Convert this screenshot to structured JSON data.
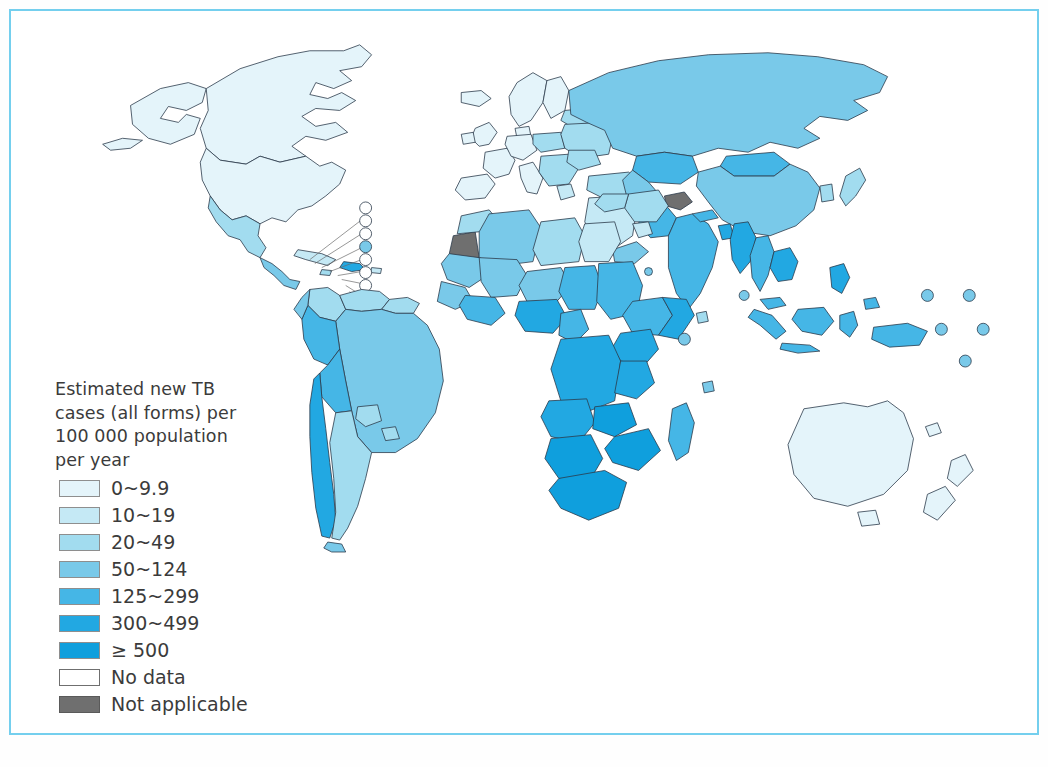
{
  "figure": {
    "domain": "map",
    "kind": "choropleth-world-map",
    "frame_color": "#74cfee",
    "background": "#ffffff"
  },
  "legend": {
    "title": "Estimated new TB\ncases (all forms) per\n100 000 population\nper year",
    "title_lines": [
      "Estimated new TB",
      "cases  (all forms)  per",
      "100 000 population",
      "per year"
    ],
    "items": [
      {
        "label": "0~9.9",
        "color": "#e4f4fa",
        "border": "#8e8e8e"
      },
      {
        "label": "10~19",
        "color": "#c5e9f5",
        "border": "#8e8e8e"
      },
      {
        "label": "20~49",
        "color": "#a2dcef",
        "border": "#8e8e8e"
      },
      {
        "label": "50~124",
        "color": "#79c9e9",
        "border": "#8e8e8e"
      },
      {
        "label": "125~299",
        "color": "#45b6e6",
        "border": "#8e8e8e"
      },
      {
        "label": "300~499",
        "color": "#22a8e2",
        "border": "#8e8e8e"
      },
      {
        "label": "≥ 500",
        "color": "#0f9fdd",
        "border": "#8e8e8e"
      },
      {
        "label": "No data",
        "color": "#ffffff",
        "border": "#6f6f6f"
      },
      {
        "label": "Not applicable",
        "color": "#6f6f6f",
        "border": "#5a5a5a"
      }
    ]
  },
  "map_data": {
    "type": "choropleth",
    "variable": "Estimated new TB cases (all forms) per 100 000 population per year",
    "classes": [
      "0~9.9",
      "10~19",
      "20~49",
      "50~124",
      "125~299",
      "300~499",
      "≥ 500",
      "No data",
      "Not applicable"
    ],
    "regions": [
      {
        "name": "Canada",
        "class": "0~9.9"
      },
      {
        "name": "United States of America",
        "class": "0~9.9"
      },
      {
        "name": "Greenland",
        "class": "125~299"
      },
      {
        "name": "Mexico",
        "class": "20~49"
      },
      {
        "name": "Central America",
        "class": "50~124"
      },
      {
        "name": "Cuba",
        "class": "10~19"
      },
      {
        "name": "Haiti",
        "class": "300~499"
      },
      {
        "name": "Colombia",
        "class": "20~49"
      },
      {
        "name": "Venezuela",
        "class": "20~49"
      },
      {
        "name": "Brazil",
        "class": "50~124"
      },
      {
        "name": "Peru",
        "class": "125~299"
      },
      {
        "name": "Bolivia",
        "class": "125~299"
      },
      {
        "name": "Ecuador",
        "class": "50~124"
      },
      {
        "name": "Chile",
        "class": "10~19"
      },
      {
        "name": "Argentina",
        "class": "20~49"
      },
      {
        "name": "Western Europe",
        "class": "0~9.9"
      },
      {
        "name": "Eastern Europe",
        "class": "20~49"
      },
      {
        "name": "Russian Federation",
        "class": "50~124"
      },
      {
        "name": "Kazakhstan",
        "class": "125~299"
      },
      {
        "name": "China",
        "class": "50~124"
      },
      {
        "name": "Mongolia",
        "class": "125~299"
      },
      {
        "name": "India",
        "class": "125~299"
      },
      {
        "name": "Pakistan",
        "class": "125~299"
      },
      {
        "name": "Bangladesh",
        "class": "300~499"
      },
      {
        "name": "Myanmar",
        "class": "300~499"
      },
      {
        "name": "Indonesia",
        "class": "125~299"
      },
      {
        "name": "Philippines",
        "class": "300~499"
      },
      {
        "name": "Japan",
        "class": "20~49"
      },
      {
        "name": "Australia",
        "class": "0~9.9"
      },
      {
        "name": "New Zealand",
        "class": "0~9.9"
      },
      {
        "name": "Northern Africa",
        "class": "20~49"
      },
      {
        "name": "Sub-Saharan Africa",
        "class": "300~499"
      },
      {
        "name": "Southern Africa",
        "class": "≥ 500"
      },
      {
        "name": "Western Sahara",
        "class": "Not applicable"
      },
      {
        "name": "Jammu and Kashmir",
        "class": "Not applicable"
      }
    ]
  }
}
